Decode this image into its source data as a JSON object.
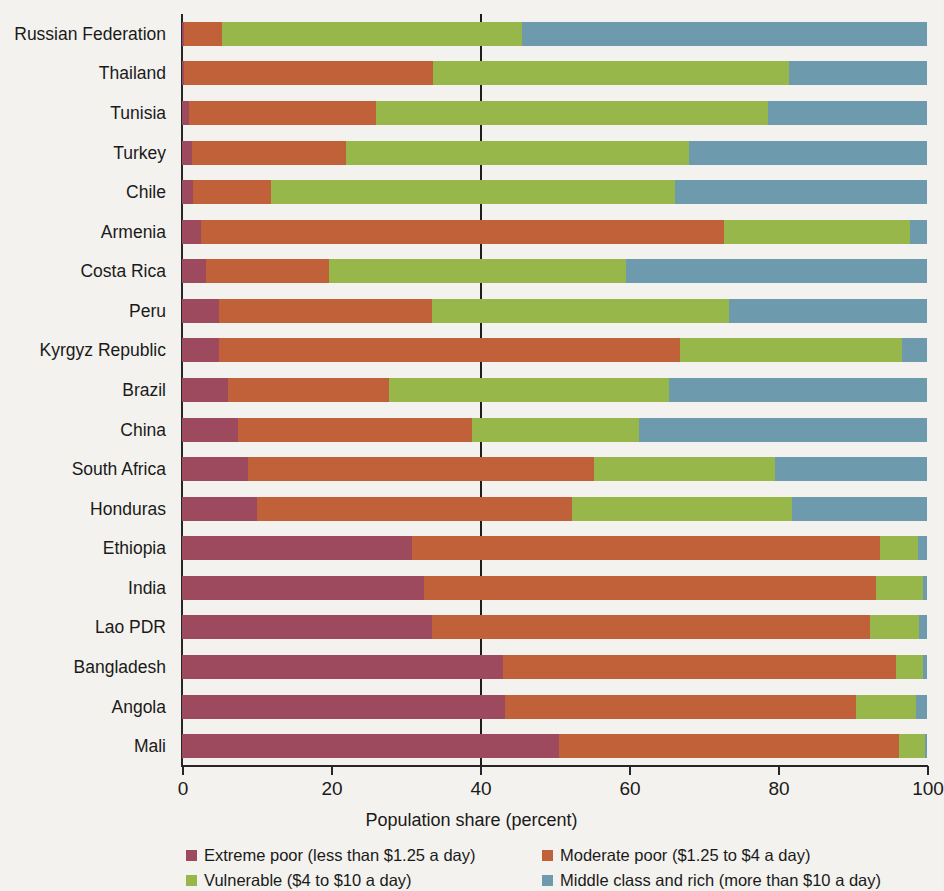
{
  "chart_data": {
    "type": "bar",
    "orientation": "horizontal",
    "stacked": true,
    "stack_total": 100,
    "title": "",
    "xlabel": "Population share (percent)",
    "ylabel": "",
    "xlim": [
      0,
      100
    ],
    "xticks": [
      0,
      20,
      40,
      60,
      80,
      100
    ],
    "xtick_labels": [
      "0",
      "20",
      "40",
      "60",
      "80",
      "100"
    ],
    "grid": false,
    "reference_line": 40,
    "legend_position": "bottom",
    "categories": [
      "Russian Federation",
      "Thailand",
      "Tunisia",
      "Turkey",
      "Chile",
      "Armenia",
      "Costa Rica",
      "Peru",
      "Kyrgyz Republic",
      "Brazil",
      "China",
      "South Africa",
      "Honduras",
      "Ethiopia",
      "India",
      "Lao PDR",
      "Bangladesh",
      "Angola",
      "Mali"
    ],
    "series": [
      {
        "name": "Extreme poor (less than $1.25 a day)",
        "color": "#9d4a5f",
        "values": [
          0.3,
          0.3,
          1.0,
          1.3,
          1.5,
          2.5,
          3.2,
          5.0,
          5.0,
          6.2,
          7.5,
          8.9,
          10.0,
          30.9,
          32.5,
          33.5,
          43.1,
          43.3,
          50.6
        ]
      },
      {
        "name": "Moderate poor ($1.25 to $4 a day)",
        "color": "#c1613a",
        "values": [
          5.1,
          33.4,
          25.1,
          20.7,
          10.5,
          70.3,
          16.5,
          28.6,
          61.8,
          21.6,
          31.4,
          46.4,
          42.3,
          62.8,
          60.7,
          58.9,
          52.8,
          47.2,
          45.6
        ]
      },
      {
        "name": "Vulnerable ($4 to $10 a day)",
        "color": "#97b74a",
        "values": [
          40.2,
          47.8,
          52.6,
          46.1,
          54.2,
          24.9,
          39.9,
          39.8,
          29.8,
          37.6,
          22.4,
          24.3,
          29.6,
          5.1,
          6.2,
          6.5,
          3.6,
          8.0,
          3.5
        ]
      },
      {
        "name": "Middle class and rich (more than $10 a day)",
        "color": "#6d9aac",
        "values": [
          54.4,
          18.5,
          21.3,
          31.9,
          33.8,
          2.3,
          40.4,
          26.6,
          3.4,
          34.6,
          38.7,
          20.4,
          18.1,
          1.2,
          0.6,
          1.1,
          0.5,
          1.5,
          0.3
        ]
      }
    ]
  },
  "axis": {
    "x_title": "Population share (percent)"
  }
}
